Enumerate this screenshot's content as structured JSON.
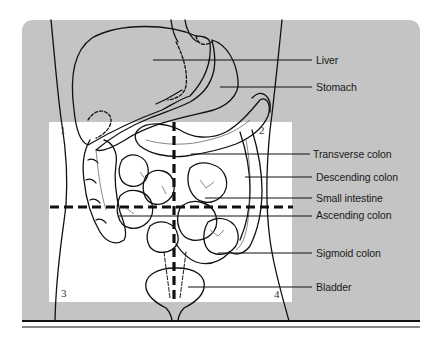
{
  "figure": {
    "colors": {
      "panel_gray": "#c4c4c4",
      "quadrant_area": "#ffffff",
      "ink": "#111111"
    },
    "labels": [
      {
        "id": "liver",
        "text": "Liver",
        "x": 316,
        "y": 54,
        "line_from_x": 153,
        "line_y": 60
      },
      {
        "id": "stomach",
        "text": "Stomach",
        "x": 316,
        "y": 81,
        "line_from_x": 220,
        "line_y": 87
      },
      {
        "id": "transverse-colon",
        "text": "Transverse colon",
        "x": 313,
        "y": 148,
        "line_from_x": 191,
        "line_y": 154
      },
      {
        "id": "descending-colon",
        "text": "Descending colon",
        "x": 316,
        "y": 170,
        "line_from_x": 245,
        "line_y": 177
      },
      {
        "id": "small-intestine",
        "text": "Small intestine",
        "x": 316,
        "y": 192,
        "line_from_x": 205,
        "line_y": 198
      },
      {
        "id": "ascending-colon",
        "text": "Ascending colon",
        "x": 316,
        "y": 209,
        "line_from_x": 119,
        "line_y": 216
      },
      {
        "id": "sigmoid-colon",
        "text": "Sigmoid colon",
        "x": 316,
        "y": 247,
        "line_from_x": 218,
        "line_y": 253
      },
      {
        "id": "bladder",
        "text": "Bladder",
        "x": 316,
        "y": 281,
        "line_from_x": 188,
        "line_y": 287
      }
    ],
    "quadrants": [
      {
        "id": "1",
        "text": "1",
        "x": 60,
        "y": 124
      },
      {
        "id": "2",
        "text": "2",
        "x": 260,
        "y": 124
      },
      {
        "id": "3",
        "text": "3",
        "x": 61,
        "y": 286
      },
      {
        "id": "4",
        "text": "4",
        "x": 274,
        "y": 288
      }
    ]
  }
}
